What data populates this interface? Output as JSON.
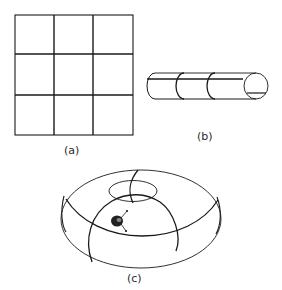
{
  "figure": {
    "panels": [
      {
        "id": "a",
        "label": "(a)",
        "description": "Flat square sheet divided into a 3x3 grid"
      },
      {
        "id": "b",
        "label": "(b)",
        "description": "Cylinder formed by joining two opposite edges of the grid"
      },
      {
        "id": "c",
        "label": "(c)",
        "description": "Torus formed by joining both pairs of edges, with a small creature on its surface"
      }
    ],
    "colors": {
      "line": "#1a1a1a",
      "thin_line": "#3a3a3a",
      "background": "#ffffff",
      "blob": "#222222"
    }
  }
}
